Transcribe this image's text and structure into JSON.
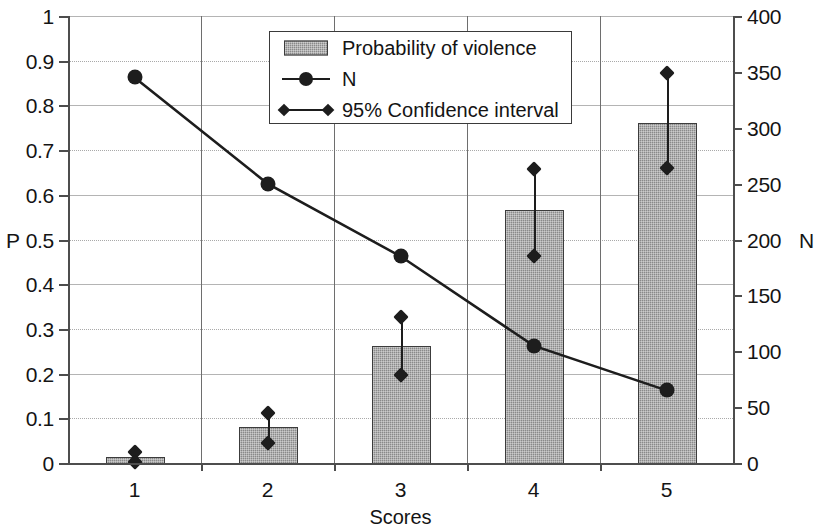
{
  "chart_data": {
    "type": "bar",
    "title": "",
    "xlabel": "Scores",
    "ylabel": "P",
    "y2label": "N",
    "categories": [
      "1",
      "2",
      "3",
      "4",
      "5"
    ],
    "ylim": [
      0,
      1
    ],
    "y2lim": [
      0,
      400
    ],
    "yticks": [
      "0",
      "0.1",
      "0.2",
      "0.3",
      "0.4",
      "0.5",
      "0.6",
      "0.7",
      "0.8",
      "0.9",
      "1"
    ],
    "y2ticks": [
      "0",
      "50",
      "100",
      "150",
      "200",
      "250",
      "300",
      "350",
      "400"
    ],
    "grid": true,
    "legend_position": "top-center",
    "series": [
      {
        "name": "Probability of violence",
        "type": "bar",
        "axis": "left",
        "values": [
          0.013,
          0.08,
          0.262,
          0.565,
          0.76
        ]
      },
      {
        "name": "N",
        "type": "line",
        "axis": "right",
        "values": [
          345,
          250,
          185,
          105,
          65
        ]
      },
      {
        "name": "95% Confidence interval",
        "type": "errorbar",
        "axis": "left",
        "lower": [
          0.003,
          0.045,
          0.197,
          0.462,
          0.66
        ],
        "upper": [
          0.025,
          0.112,
          0.327,
          0.658,
          0.872
        ]
      }
    ]
  },
  "legend": {
    "items": [
      {
        "label": "Probability of violence",
        "marker": "filled-rect-swatch"
      },
      {
        "label": "N",
        "marker": "line-circle-marker"
      },
      {
        "label": "95% Confidence interval",
        "marker": "line-diamond-marker"
      }
    ]
  },
  "colors": {
    "bar_fill": "#8a8a8a",
    "bar_stroke": "#3c3c3c",
    "line": "#1d1d1d",
    "axis": "#4d4d4d",
    "grid": "#a9a9a9",
    "text": "#141414",
    "background": "#ffffff"
  }
}
